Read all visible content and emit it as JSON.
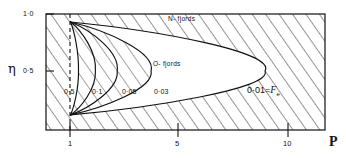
{
  "figure": {
    "axes": {
      "y_axis_label": "η",
      "x_axis_label": "P",
      "y_ticks": [
        {
          "value": 1.0,
          "label": "1·0"
        },
        {
          "value": 0.5,
          "label": "0·5"
        }
      ],
      "x_ticks": [
        {
          "value": 1,
          "label": "1"
        },
        {
          "value": 5,
          "label": "5"
        },
        {
          "value": 10,
          "label": "10"
        }
      ],
      "xlim": [
        0.55,
        11.5
      ],
      "ylim": [
        0.06,
        1.0
      ]
    },
    "region_labels": [
      {
        "name": "n-fjords",
        "text": "N- fjords"
      },
      {
        "name": "o-fjords",
        "text": "O- fjords"
      }
    ],
    "contour_labels": [
      {
        "name": "contour-0-5",
        "text": "0·5"
      },
      {
        "name": "contour-0-1",
        "text": "0·1"
      },
      {
        "name": "contour-0-05",
        "text": "0·05"
      },
      {
        "name": "contour-0-03",
        "text": "0·03"
      }
    ],
    "legend_equation": {
      "value": "0·01=",
      "symbol": "F",
      "subscript": "e"
    },
    "dashed_line": {
      "name": "p-equals-one-line",
      "value": 1
    },
    "colors": {
      "ink": "#111111",
      "background": "#ffffff"
    }
  },
  "chart_data": {
    "type": "line",
    "title": "",
    "xlabel": "P",
    "ylabel": "η",
    "xlim": [
      0.55,
      11.5
    ],
    "ylim": [
      0.06,
      1.0
    ],
    "grid": false,
    "legend": "inline-contour-labels",
    "annotations": [
      {
        "text": "N- fjords",
        "x": 6.0,
        "y": 0.94
      },
      {
        "text": "O- fjords",
        "x": 5.4,
        "y": 0.6
      },
      {
        "text": "0·01=Fe",
        "x": 9.2,
        "y": 0.42
      }
    ],
    "series": [
      {
        "name": "0·5",
        "label": "0·5",
        "Fe": 0.5,
        "nose_P": 1.35,
        "x": [
          1.02,
          1.12,
          1.24,
          1.32,
          1.35,
          1.3,
          1.2,
          1.1,
          1.05,
          1.02
        ],
        "y": [
          0.92,
          0.84,
          0.72,
          0.6,
          0.5,
          0.38,
          0.28,
          0.2,
          0.14,
          0.1
        ]
      },
      {
        "name": "0·1",
        "label": "0·1",
        "Fe": 0.1,
        "nose_P": 2.05,
        "x": [
          1.02,
          1.35,
          1.7,
          1.95,
          2.05,
          1.95,
          1.7,
          1.4,
          1.15,
          1.02
        ],
        "y": [
          0.92,
          0.84,
          0.72,
          0.6,
          0.5,
          0.38,
          0.28,
          0.2,
          0.14,
          0.1
        ]
      },
      {
        "name": "0·05",
        "label": "0·05",
        "Fe": 0.05,
        "nose_P": 2.95,
        "x": [
          1.02,
          1.6,
          2.2,
          2.7,
          2.95,
          2.8,
          2.35,
          1.8,
          1.3,
          1.02
        ],
        "y": [
          0.92,
          0.84,
          0.72,
          0.6,
          0.5,
          0.38,
          0.28,
          0.2,
          0.14,
          0.1
        ]
      },
      {
        "name": "0·03",
        "label": "0·03",
        "Fe": 0.03,
        "nose_P": 4.35,
        "x": [
          1.02,
          2.0,
          3.0,
          3.9,
          4.35,
          4.1,
          3.3,
          2.3,
          1.5,
          1.02
        ],
        "y": [
          0.92,
          0.84,
          0.72,
          0.6,
          0.5,
          0.38,
          0.28,
          0.2,
          0.14,
          0.1
        ]
      },
      {
        "name": "0·01",
        "label": "0·01",
        "Fe": 0.01,
        "nose_P": 9.05,
        "x": [
          1.02,
          3.4,
          5.6,
          7.8,
          9.05,
          8.5,
          6.6,
          4.2,
          2.2,
          1.02
        ],
        "y": [
          0.92,
          0.84,
          0.72,
          0.6,
          0.5,
          0.38,
          0.28,
          0.2,
          0.14,
          0.1
        ]
      }
    ]
  }
}
